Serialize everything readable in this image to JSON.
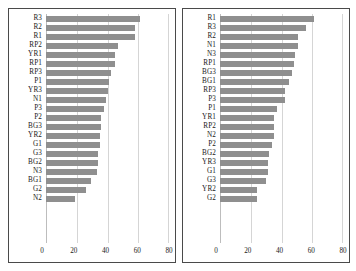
{
  "chart_data": [
    {
      "type": "bar",
      "orientation": "horizontal",
      "title": "",
      "xlabel": "",
      "ylabel": "",
      "xlim": [
        0,
        80
      ],
      "xticks": [
        0,
        20,
        40,
        60,
        80
      ],
      "grid": true,
      "legend": false,
      "bar_color": "#8f8f8f",
      "categories": [
        "R3",
        "R2",
        "R1",
        "RP2",
        "YR1",
        "RP1",
        "RP3",
        "P1",
        "YR3",
        "N1",
        "P3",
        "P2",
        "BG3",
        "YR2",
        "G1",
        "G3",
        "BG2",
        "N3",
        "BG1",
        "G2",
        "N2"
      ],
      "values": [
        61,
        58,
        58,
        47,
        45,
        45,
        42,
        41,
        40,
        39,
        38,
        36,
        36,
        35,
        35,
        34,
        34,
        33,
        29,
        26,
        19
      ]
    },
    {
      "type": "bar",
      "orientation": "horizontal",
      "title": "",
      "xlabel": "",
      "ylabel": "",
      "xlim": [
        0,
        80
      ],
      "xticks": [
        0,
        20,
        40,
        60,
        80
      ],
      "grid": true,
      "legend": false,
      "bar_color": "#8f8f8f",
      "categories": [
        "R1",
        "R3",
        "R2",
        "N1",
        "N3",
        "RP1",
        "BG3",
        "BG1",
        "RP3",
        "P3",
        "P1",
        "YR1",
        "RP2",
        "N2",
        "P2",
        "BG2",
        "YR3",
        "G1",
        "G3",
        "YR2",
        "G2"
      ],
      "values": [
        61,
        56,
        51,
        51,
        49,
        48,
        47,
        45,
        42,
        42,
        37,
        35,
        35,
        35,
        34,
        32,
        31,
        31,
        30,
        24,
        24
      ]
    }
  ]
}
